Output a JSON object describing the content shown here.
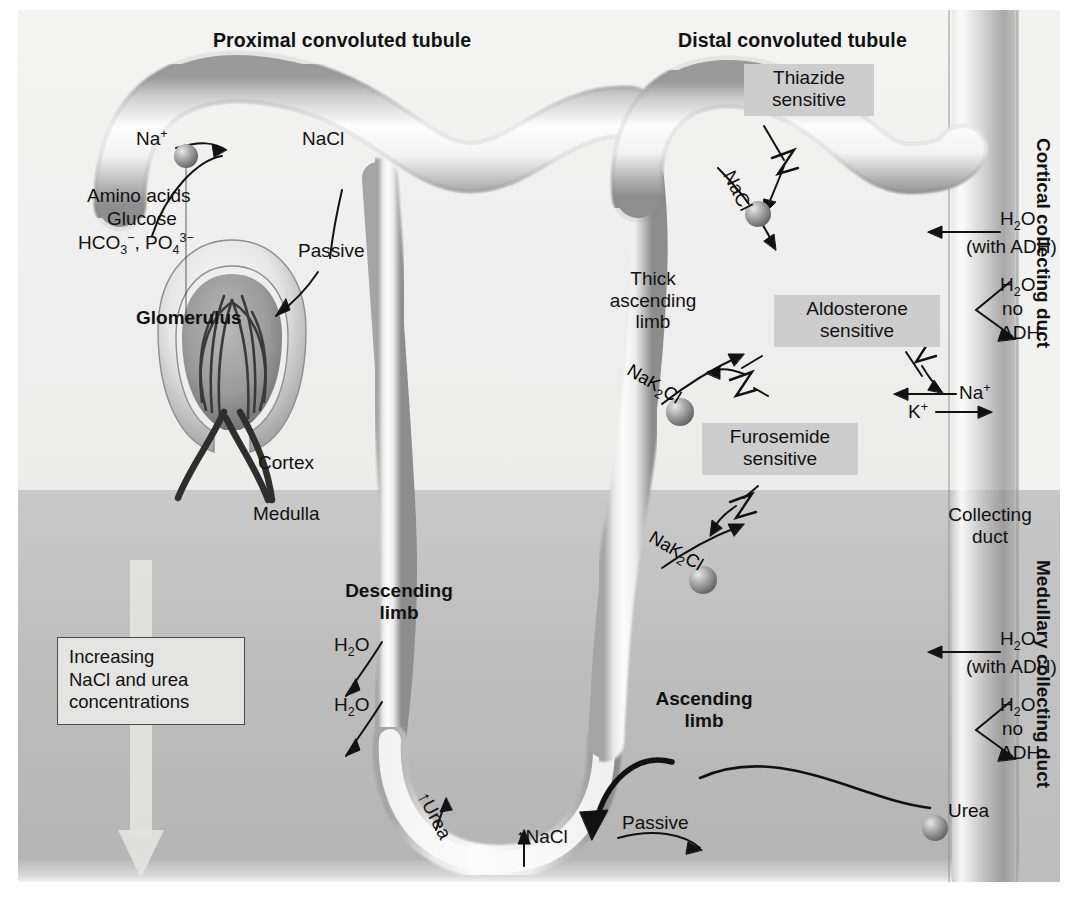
{
  "titles": {
    "proximal": "Proximal convoluted tubule",
    "distal": "Distal convoluted tubule"
  },
  "regions": {
    "cortex": "Cortex",
    "medulla": "Medulla",
    "cortical_collecting_duct": "Cortical collecting duct",
    "medullary_collecting_duct": "Medullary collecting duct",
    "collecting_duct": "Collecting\nduct"
  },
  "proximal": {
    "na": "Na",
    "na_sup": "+",
    "nacl": "NaCl",
    "passive": "Passive",
    "solutes_line1": "Amino acids",
    "solutes_line2": "Glucose",
    "solutes_line3_a": "HCO",
    "solutes_line3_a_sub": "3",
    "solutes_line3_a_sup": "−",
    "solutes_line3_b": ", PO",
    "solutes_line3_b_sub": "4",
    "solutes_line3_b_sup": "3−"
  },
  "glomerulus": {
    "label": "Glomerulus"
  },
  "loop": {
    "thick_ascending": "Thick\nascending\nlimb",
    "descending_limb": "Descending\nlimb",
    "ascending_limb": "Ascending\nlimb",
    "h2o_1": "H",
    "h2o_1_sub": "2",
    "h2o_1_tail": "O",
    "h2o_2": "H",
    "h2o_2_sub": "2",
    "h2o_2_tail": "O",
    "urea_up": "↑Urea",
    "nacl_up": "↑NaCl",
    "passive": "Passive"
  },
  "transporters": {
    "nak2cl_upper_a": "NaK",
    "nak2cl_upper_sub": "2",
    "nak2cl_upper_b": "Cl",
    "nak2cl_lower_a": "NaK",
    "nak2cl_lower_sub": "2",
    "nak2cl_lower_b": "Cl",
    "nacl_distal": "NaCl"
  },
  "drugs": {
    "thiazide": "Thiazide\nsensitive",
    "furosemide": "Furosemide\nsensitive",
    "aldosterone": "Aldosterone\nsensitive"
  },
  "collecting_cortical": {
    "h2o": "H",
    "h2o_sub": "2",
    "h2o_tail": "O",
    "with_adh": "(with ADH)",
    "h2o_no_adh_1": "H",
    "h2o_no_adh_1_sub": "2",
    "h2o_no_adh_1_tail": "O",
    "no": "no",
    "adh": "ADH",
    "na": "Na",
    "na_sup": "+",
    "k": "K",
    "k_sup": "+"
  },
  "collecting_medullary": {
    "h2o": "H",
    "h2o_sub": "2",
    "h2o_tail": "O",
    "with_adh": "(with ADH)",
    "h2o_no_adh_1": "H",
    "h2o_no_adh_1_sub": "2",
    "h2o_no_adh_1_tail": "O",
    "no": "no",
    "adh": "ADH",
    "urea": "Urea"
  },
  "gradient_box": {
    "line1": "Increasing",
    "line2": "NaCl and urea",
    "line3": "concentrations"
  },
  "colors": {
    "cortex_bg": "#f1f1f0",
    "medulla_bg": "#c0c0c0",
    "highlight_box": "#cdcdcd",
    "text": "#111111",
    "tubule_light": "#fbfbfb",
    "tubule_shade": "#8f8f8f"
  }
}
